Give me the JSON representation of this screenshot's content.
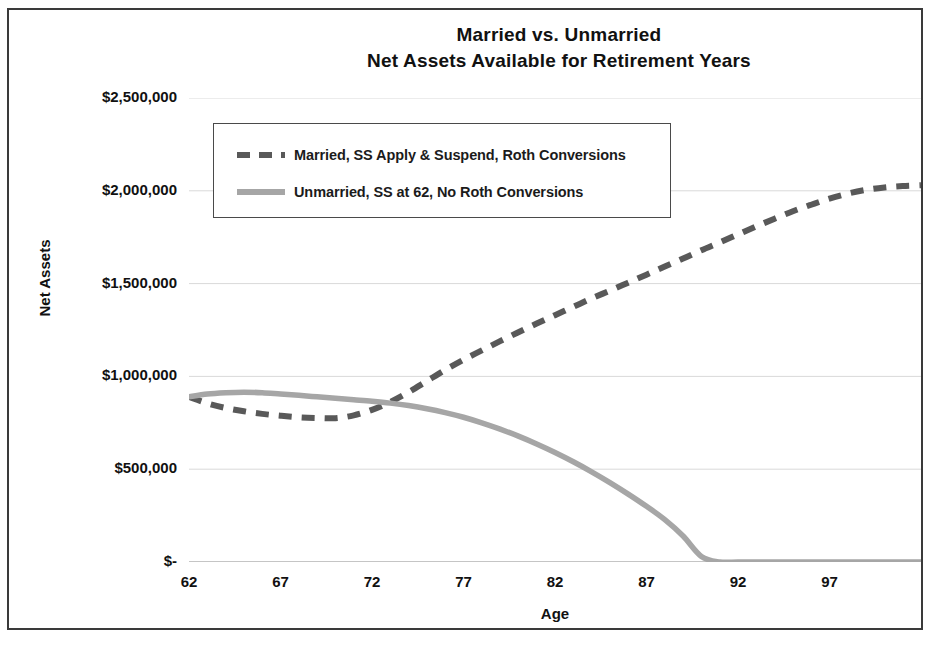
{
  "chart_data": {
    "type": "line",
    "title": "Married vs. Unmarried",
    "subtitle": "Net Assets Available for Retirement Years",
    "title_line1": "Married vs. Unmarried",
    "title_line2": "Net Assets Available for Retirement Years",
    "xlabel": "Age",
    "ylabel": "Net Assets",
    "xlim": [
      62,
      102
    ],
    "ylim": [
      0,
      2500000
    ],
    "grid": true,
    "legend_position": "upper-left-inside",
    "y_ticks": [
      2500000,
      2000000,
      1500000,
      1000000,
      500000,
      0
    ],
    "y_tick_labels": [
      "$2,500,000",
      "$2,000,000",
      "$1,500,000",
      "$1,000,000",
      "$500,000",
      "$-"
    ],
    "x_ticks": [
      62,
      67,
      72,
      77,
      82,
      87,
      92,
      97
    ],
    "x_tick_labels": [
      "62",
      "67",
      "72",
      "77",
      "82",
      "87",
      "92",
      "97"
    ],
    "x": [
      62,
      63,
      64,
      65,
      66,
      67,
      68,
      69,
      70,
      71,
      72,
      73,
      74,
      75,
      76,
      77,
      78,
      79,
      80,
      81,
      82,
      83,
      84,
      85,
      86,
      87,
      88,
      89,
      90,
      91,
      92,
      93,
      94,
      95,
      96,
      97,
      98,
      99,
      100,
      101,
      102
    ],
    "series": [
      {
        "name": "Married, SS Apply & Suspend, Roth Conversions",
        "style": "dashed",
        "color": "#595959",
        "values": [
          890000,
          855000,
          830000,
          812000,
          798000,
          788000,
          780000,
          776000,
          775000,
          790000,
          820000,
          862000,
          915000,
          975000,
          1035000,
          1090000,
          1140000,
          1190000,
          1238000,
          1285000,
          1330000,
          1375000,
          1420000,
          1462000,
          1505000,
          1548000,
          1592000,
          1635000,
          1680000,
          1722000,
          1765000,
          1808000,
          1850000,
          1890000,
          1925000,
          1958000,
          1985000,
          2005000,
          2018000,
          2026000,
          2030000
        ]
      },
      {
        "name": "Unmarried, SS at 62, No Roth Conversions",
        "style": "solid",
        "color": "#a6a6a6",
        "values": [
          890000,
          905000,
          912000,
          915000,
          912000,
          905000,
          898000,
          890000,
          882000,
          874000,
          866000,
          856000,
          843000,
          826000,
          805000,
          780000,
          750000,
          716000,
          678000,
          636000,
          590000,
          540000,
          486000,
          428000,
          366000,
          300000,
          228000,
          140000,
          30000,
          0,
          0,
          0,
          0,
          0,
          0,
          0,
          0,
          0,
          0,
          0,
          0
        ]
      }
    ]
  },
  "legend": {
    "items": [
      {
        "label": "Married, SS Apply & Suspend, Roth Conversions",
        "style": "dashed",
        "color": "#595959"
      },
      {
        "label": "Unmarried, SS at 62, No Roth Conversions",
        "style": "solid",
        "color": "#a6a6a6"
      }
    ]
  }
}
